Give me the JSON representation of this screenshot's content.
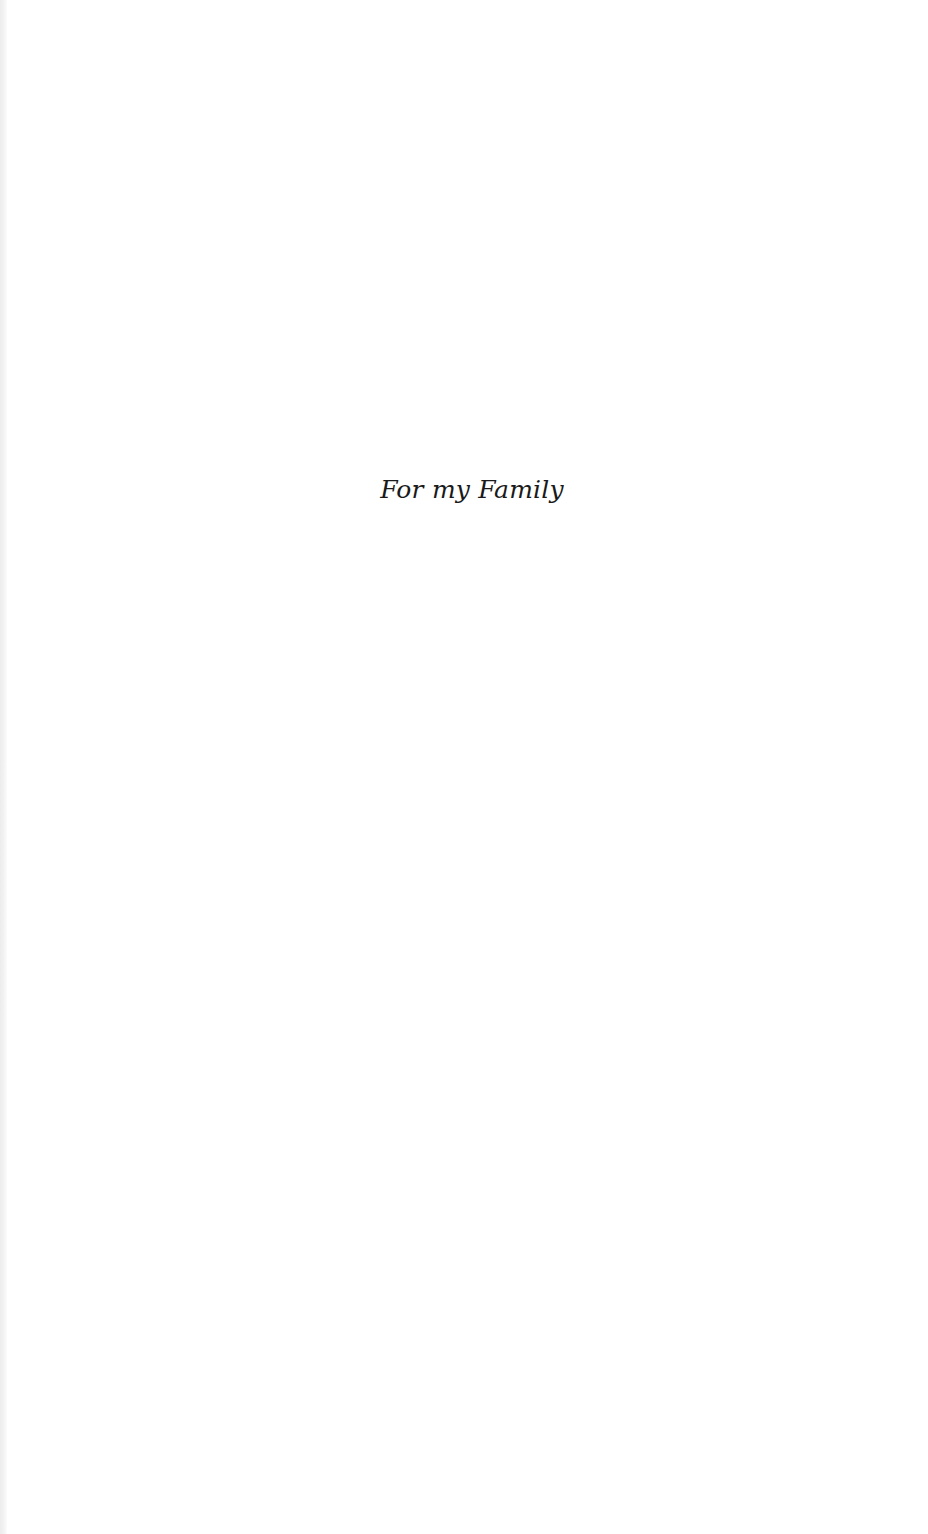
{
  "page": {
    "dedication": "For my Family"
  }
}
